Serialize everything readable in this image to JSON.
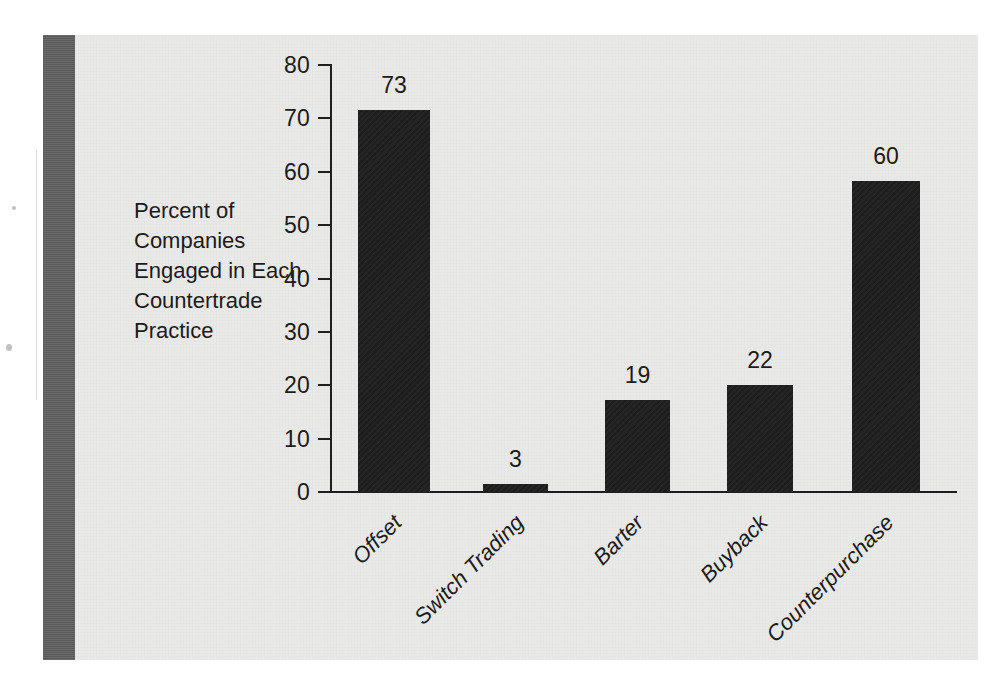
{
  "figure": {
    "background_color": "#ffffff",
    "panel_color": "#e9e9e7",
    "spine_color": "#5f5f5f",
    "bar_color": "#1d1d1d",
    "axis_color": "#1e1e1e"
  },
  "axis_title_lines": [
    "Percent of",
    "Companies",
    "Engaged in Each",
    "Countertrade",
    "Practice"
  ],
  "chart_data": {
    "type": "bar",
    "title": "",
    "subtitle": "",
    "xlabel": "",
    "ylabel": "Percent of Companies Engaged in Each Countertrade Practice",
    "categories": [
      "Offset",
      "Switch Trading",
      "Barter",
      "Buyback",
      "Counterpurchase"
    ],
    "values": [
      73,
      19,
      3,
      22,
      60
    ],
    "series": [
      {
        "name": "Percent of Companies Engaged in Each Countertrade Practice",
        "values": [
          73,
          3,
          19,
          22,
          60
        ]
      }
    ],
    "data_labels": [
      "73",
      "3",
      "19",
      "22",
      "60"
    ],
    "ylim": [
      0,
      80
    ],
    "ytick_values": [
      0,
      10,
      20,
      30,
      40,
      50,
      60,
      70,
      80
    ],
    "ytick_labels": [
      "0",
      "10",
      "20",
      "30",
      "40",
      "50",
      "60",
      "70",
      "80"
    ],
    "grid": false,
    "legend": false,
    "legend_position": "none",
    "category_label_rotation": -45,
    "bar_color": "#1d1d1d"
  },
  "bars": [
    {
      "category": "Offset",
      "label": "73",
      "value": 73,
      "plot_value": 71.5
    },
    {
      "category": "Switch Trading",
      "label": "3",
      "value": 3,
      "plot_value": 1.5
    },
    {
      "category": "Barter",
      "label": "19",
      "value": 19,
      "plot_value": 17.2
    },
    {
      "category": "Buyback",
      "label": "22",
      "value": 22,
      "plot_value": 20.1
    },
    {
      "category": "Counterpurchase",
      "label": "60",
      "value": 60,
      "plot_value": 58.2
    }
  ],
  "ticks": [
    {
      "label": "80",
      "value": 80
    },
    {
      "label": "70",
      "value": 70
    },
    {
      "label": "60",
      "value": 60
    },
    {
      "label": "50",
      "value": 50
    },
    {
      "label": "40",
      "value": 40
    },
    {
      "label": "30",
      "value": 30
    },
    {
      "label": "20",
      "value": 20
    },
    {
      "label": "10",
      "value": 10
    },
    {
      "label": "0",
      "value": 0
    }
  ]
}
